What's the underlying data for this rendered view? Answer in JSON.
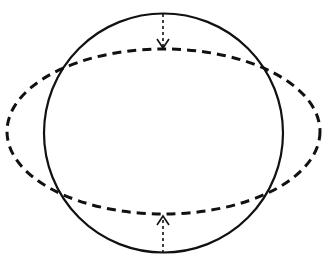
{
  "diagram": {
    "colors": {
      "stroke": "#111111",
      "background": "#ffffff"
    },
    "circle": {
      "cx": 163.5,
      "cy": 133,
      "r": 119.5,
      "style": "solid",
      "stroke_width": 2.2
    },
    "ellipse": {
      "cx": 163.5,
      "cy": 131.5,
      "rx": 156.5,
      "ry": 82.5,
      "style": "dashed",
      "stroke_width": 3,
      "dash": "9,6"
    },
    "arrows": [
      {
        "name": "top-compression-arrow",
        "x": 163,
        "y1": 14,
        "y2": 48,
        "direction": "down",
        "style": "dashed"
      },
      {
        "name": "bottom-compression-arrow",
        "x": 163,
        "y1": 253,
        "y2": 216,
        "direction": "up",
        "style": "dashed"
      }
    ]
  }
}
